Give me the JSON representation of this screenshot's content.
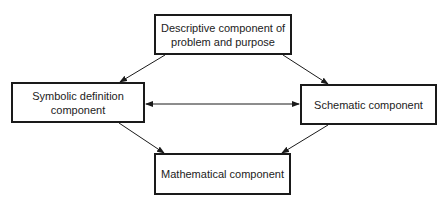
{
  "diagram": {
    "nodes": [
      {
        "id": "descriptive",
        "label": "Descriptive component of problem and purpose"
      },
      {
        "id": "symbolic",
        "label": "Symbolic definition component"
      },
      {
        "id": "schematic",
        "label": "Schematic component"
      },
      {
        "id": "mathematical",
        "label": "Mathematical component"
      }
    ],
    "edges": [
      {
        "from": "descriptive",
        "to": "symbolic",
        "type": "arrow"
      },
      {
        "from": "descriptive",
        "to": "schematic",
        "type": "arrow"
      },
      {
        "from": "symbolic",
        "to": "schematic",
        "type": "bidirectional-arrow"
      },
      {
        "from": "symbolic",
        "to": "mathematical",
        "type": "arrow"
      },
      {
        "from": "schematic",
        "to": "mathematical",
        "type": "arrow"
      }
    ],
    "colors": {
      "line": "#1a1a1a",
      "background": "#ffffff",
      "text": "#222222"
    }
  }
}
